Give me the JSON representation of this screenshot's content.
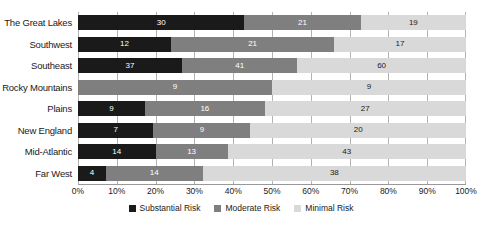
{
  "chart_data": {
    "type": "bar",
    "orientation": "horizontal",
    "stacked": true,
    "normalized": true,
    "title": "",
    "subtitle": "",
    "xlabel": "",
    "ylabel": "",
    "xlim": [
      0,
      100
    ],
    "grid": true,
    "legend_position": "bottom",
    "categories": [
      "The Great Lakes",
      "Southwest",
      "Southeast",
      "Rocky Mountains",
      "Plains",
      "New England",
      "Mid-Atlantic",
      "Far West"
    ],
    "series": [
      {
        "name": "Substantial Risk",
        "color": "#1a1a1a",
        "values": [
          30,
          12,
          37,
          0,
          9,
          7,
          14,
          4
        ]
      },
      {
        "name": "Moderate Risk",
        "color": "#7f7f7f",
        "values": [
          21,
          21,
          41,
          9,
          16,
          9,
          13,
          14
        ]
      },
      {
        "name": "Minimal Risk",
        "color": "#d9d9d9",
        "values": [
          19,
          17,
          60,
          9,
          27,
          20,
          43,
          38
        ]
      }
    ],
    "xticks": [
      "0%",
      "10%",
      "20%",
      "30%",
      "40%",
      "50%",
      "60%",
      "70%",
      "80%",
      "90%",
      "100%"
    ],
    "xtick_values": [
      0,
      10,
      20,
      30,
      40,
      50,
      60,
      70,
      80,
      90,
      100
    ],
    "legend": [
      "Substantial Risk",
      "Moderate Risk",
      "Minimal Risk"
    ],
    "data_labels": [
      {
        "category": "The Great Lakes",
        "Substantial Risk": 30,
        "Moderate Risk": 21,
        "Minimal Risk": 19,
        "total": 70
      },
      {
        "category": "Southwest",
        "Substantial Risk": 12,
        "Moderate Risk": 21,
        "Minimal Risk": 17,
        "total": 50
      },
      {
        "category": "Southeast",
        "Substantial Risk": 37,
        "Moderate Risk": 41,
        "Minimal Risk": 60,
        "total": 138
      },
      {
        "category": "Rocky Mountains",
        "Substantial Risk": 0,
        "Moderate Risk": 9,
        "Minimal Risk": 9,
        "total": 18
      },
      {
        "category": "Plains",
        "Substantial Risk": 9,
        "Moderate Risk": 16,
        "Minimal Risk": 27,
        "total": 52
      },
      {
        "category": "New England",
        "Substantial Risk": 7,
        "Moderate Risk": 9,
        "Minimal Risk": 20,
        "total": 36
      },
      {
        "category": "Mid-Atlantic",
        "Substantial Risk": 14,
        "Moderate Risk": 13,
        "Minimal Risk": 43,
        "total": 70
      },
      {
        "category": "Far West",
        "Substantial Risk": 4,
        "Moderate Risk": 14,
        "Minimal Risk": 38,
        "total": 56
      }
    ]
  },
  "colors": {
    "substantial": "#1a1a1a",
    "moderate": "#7f7f7f",
    "minimal": "#d9d9d9",
    "gridline": "#b3b3b3",
    "background": "#ffffff",
    "text": "#1a1a1a"
  }
}
